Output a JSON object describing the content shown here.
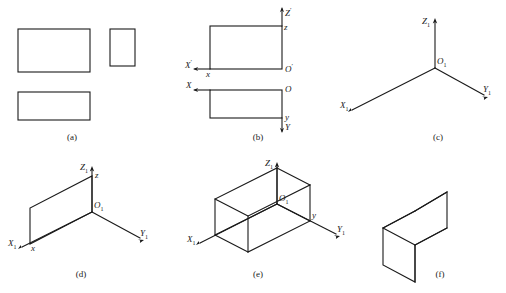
{
  "figure": {
    "stroke_color": "#1a1a1a",
    "background": "#ffffff",
    "panels": [
      {
        "id": "a",
        "caption": "(a)",
        "description": "three orthographic views: front, side, top",
        "labels": []
      },
      {
        "id": "b",
        "caption": "(b)",
        "description": "orthographic views with projection axes marked",
        "labels": [
          {
            "name": "z-prime-axis-label",
            "text": "Z'"
          },
          {
            "name": "z-lower-label",
            "text": "z"
          },
          {
            "name": "x-prime-axis-label",
            "text": "X'"
          },
          {
            "name": "x-lower-upper-label",
            "text": "x"
          },
          {
            "name": "o-prime-origin-label",
            "text": "O'"
          },
          {
            "name": "x-axis-label",
            "text": "X"
          },
          {
            "name": "o-origin-label",
            "text": "O"
          },
          {
            "name": "y-lower-label",
            "text": "y"
          },
          {
            "name": "y-axis-label",
            "text": "Y"
          }
        ]
      },
      {
        "id": "c",
        "caption": "(c)",
        "description": "isometric axis triad",
        "labels": [
          {
            "name": "z1-axis-label",
            "text": "Z"
          },
          {
            "name": "z1-subscript",
            "text": "1"
          },
          {
            "name": "o1-origin-label",
            "text": "O"
          },
          {
            "name": "o1-subscript",
            "text": "1"
          },
          {
            "name": "x1-axis-label",
            "text": "X"
          },
          {
            "name": "x1-subscript",
            "text": "1"
          },
          {
            "name": "y1-axis-label",
            "text": "Y"
          },
          {
            "name": "y1-subscript",
            "text": "1"
          }
        ]
      },
      {
        "id": "d",
        "caption": "(d)",
        "description": "front face drawn in isometric axes",
        "labels": [
          {
            "name": "z1-axis-label",
            "text": "Z"
          },
          {
            "name": "z-lower-label",
            "text": "z"
          },
          {
            "name": "o1-origin-label",
            "text": "O"
          },
          {
            "name": "x1-axis-label",
            "text": "X"
          },
          {
            "name": "x-lower-label",
            "text": "x"
          },
          {
            "name": "y1-axis-label",
            "text": "Y"
          }
        ]
      },
      {
        "id": "e",
        "caption": "(e)",
        "description": "complete wireframe box in isometric axes",
        "labels": [
          {
            "name": "z1-axis-label",
            "text": "Z"
          },
          {
            "name": "o1-origin-label",
            "text": "O"
          },
          {
            "name": "x1-axis-label",
            "text": "X"
          },
          {
            "name": "y1-axis-label",
            "text": "Y"
          },
          {
            "name": "y-lower-label",
            "text": "y"
          }
        ]
      },
      {
        "id": "f",
        "caption": "(f)",
        "description": "finished isometric solid box",
        "labels": []
      }
    ]
  },
  "captions": {
    "a": "(a)",
    "b": "(b)",
    "c": "(c)",
    "d": "(d)",
    "e": "(e)",
    "f": "(f)"
  },
  "axis_labels": {
    "Z_prime": "Z",
    "Z_prime_sup": "'",
    "X_prime": "X",
    "X_prime_sup": "'",
    "O_prime": "O",
    "O_prime_sup": "'",
    "X": "X",
    "O": "O",
    "Y": "Y",
    "Z": "Z",
    "z_low": "z",
    "x_low": "x",
    "y_low": "y",
    "sub1": "1"
  }
}
